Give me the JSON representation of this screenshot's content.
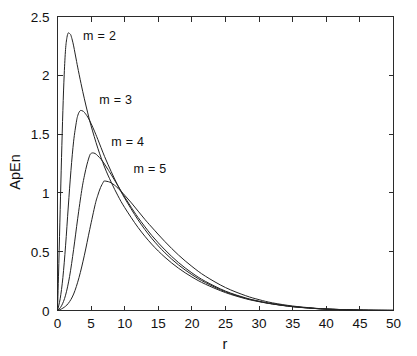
{
  "chart_data": {
    "type": "line",
    "title": "",
    "subtitle": "",
    "xlabel": "r",
    "ylabel": "ApEn",
    "xlim": [
      0,
      50
    ],
    "ylim": [
      0,
      2.5
    ],
    "xticks": [
      0,
      5,
      10,
      15,
      20,
      25,
      30,
      35,
      40,
      45,
      50
    ],
    "xtick_labels": [
      "0",
      "5",
      "10",
      "15",
      "20",
      "25",
      "30",
      "35",
      "40",
      "45",
      "50"
    ],
    "yticks": [
      0,
      0.5,
      1,
      1.5,
      2,
      2.5
    ],
    "ytick_labels": [
      "0",
      "0.5",
      "1",
      "1.5",
      "2",
      "2.5"
    ],
    "grid": false,
    "legend": "inline-annotations",
    "line_color": "#232323",
    "series": [
      {
        "name": "m = 2",
        "label": "m = 2",
        "peak_r": 1.9,
        "peak_value": 2.36,
        "x": [
          0,
          0.2,
          0.4,
          0.6,
          0.8,
          1.0,
          1.2,
          1.4,
          1.6,
          1.8,
          1.9,
          2.0,
          2.2,
          2.4,
          2.6,
          2.8,
          3.0,
          3.5,
          4.0,
          4.5,
          5.0,
          6.0,
          7.0,
          8.0,
          9.0,
          10.0,
          12.0,
          14.0,
          16.0,
          18.0,
          20.0,
          22.0,
          25.0,
          28.0,
          30.0,
          32.0,
          35.0,
          38.0,
          40.0,
          44.0,
          47.0,
          50.0
        ],
        "y": [
          0,
          0.4,
          0.86,
          1.3,
          1.7,
          2.01,
          2.22,
          2.32,
          2.36,
          2.355,
          2.35,
          2.34,
          2.3,
          2.25,
          2.19,
          2.13,
          2.07,
          1.93,
          1.8,
          1.68,
          1.57,
          1.38,
          1.22,
          1.09,
          0.975,
          0.875,
          0.705,
          0.565,
          0.452,
          0.36,
          0.285,
          0.224,
          0.152,
          0.1,
          0.075,
          0.055,
          0.032,
          0.018,
          0.012,
          0.005,
          0.002,
          0.001
        ]
      },
      {
        "name": "m = 3",
        "label": "m = 3",
        "peak_r": 3.4,
        "peak_value": 1.7,
        "x": [
          0,
          0.4,
          0.8,
          1.2,
          1.6,
          2.0,
          2.4,
          2.8,
          3.0,
          3.2,
          3.4,
          3.6,
          3.8,
          4.0,
          4.5,
          5.0,
          5.5,
          6.0,
          7.0,
          8.0,
          9.0,
          10.0,
          12.0,
          14.0,
          16.0,
          18.0,
          20.0,
          22.0,
          25.0,
          28.0,
          30.0,
          32.0,
          35.0,
          38.0,
          40.0,
          44.0,
          47.0,
          50.0
        ],
        "y": [
          0,
          0.1,
          0.28,
          0.55,
          0.88,
          1.19,
          1.44,
          1.6,
          1.655,
          1.685,
          1.7,
          1.7,
          1.695,
          1.685,
          1.645,
          1.59,
          1.525,
          1.455,
          1.31,
          1.18,
          1.06,
          0.955,
          0.77,
          0.615,
          0.49,
          0.388,
          0.305,
          0.238,
          0.159,
          0.104,
          0.077,
          0.056,
          0.033,
          0.019,
          0.012,
          0.005,
          0.002,
          0.001
        ]
      },
      {
        "name": "m = 4",
        "label": "m = 4",
        "peak_r": 5.0,
        "peak_value": 1.34,
        "x": [
          0,
          0.6,
          1.2,
          1.8,
          2.4,
          3.0,
          3.6,
          4.0,
          4.4,
          4.8,
          5.0,
          5.2,
          5.6,
          6.0,
          6.5,
          7.0,
          7.5,
          8.0,
          9.0,
          10.0,
          11.0,
          12.0,
          14.0,
          16.0,
          18.0,
          20.0,
          22.0,
          25.0,
          28.0,
          30.0,
          32.0,
          35.0,
          38.0,
          40.0,
          44.0,
          47.0,
          50.0
        ],
        "y": [
          0,
          0.04,
          0.13,
          0.29,
          0.52,
          0.78,
          1.02,
          1.145,
          1.245,
          1.32,
          1.335,
          1.34,
          1.335,
          1.315,
          1.285,
          1.245,
          1.2,
          1.155,
          1.06,
          0.965,
          0.875,
          0.79,
          0.64,
          0.515,
          0.408,
          0.32,
          0.248,
          0.165,
          0.107,
          0.079,
          0.057,
          0.034,
          0.019,
          0.012,
          0.005,
          0.002,
          0.001
        ]
      },
      {
        "name": "m = 5",
        "label": "m = 5",
        "peak_r": 6.9,
        "peak_value": 1.1,
        "x": [
          0,
          0.8,
          1.6,
          2.4,
          3.2,
          4.0,
          4.8,
          5.6,
          6.0,
          6.4,
          6.8,
          6.9,
          7.2,
          7.6,
          8.0,
          8.5,
          9.0,
          10.0,
          11.0,
          12.0,
          13.0,
          14.0,
          16.0,
          18.0,
          20.0,
          22.0,
          25.0,
          28.0,
          30.0,
          32.0,
          35.0,
          38.0,
          40.0,
          44.0,
          47.0,
          50.0
        ],
        "y": [
          0,
          0.02,
          0.06,
          0.14,
          0.28,
          0.47,
          0.69,
          0.9,
          0.98,
          1.045,
          1.09,
          1.1,
          1.1,
          1.095,
          1.085,
          1.065,
          1.04,
          0.98,
          0.915,
          0.845,
          0.775,
          0.71,
          0.585,
          0.472,
          0.375,
          0.292,
          0.195,
          0.126,
          0.092,
          0.065,
          0.038,
          0.021,
          0.013,
          0.005,
          0.002,
          0.001
        ]
      }
    ],
    "annotations": [
      {
        "text": "m = 2",
        "r": 3.8,
        "value": 2.3
      },
      {
        "text": "m = 3",
        "r": 6.2,
        "value": 1.76
      },
      {
        "text": "m = 4",
        "r": 8.0,
        "value": 1.4
      },
      {
        "text": "m = 5",
        "r": 11.3,
        "value": 1.17
      }
    ]
  }
}
